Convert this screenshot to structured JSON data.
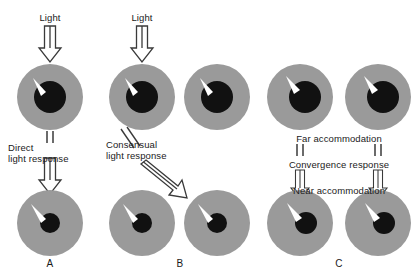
{
  "figure": {
    "background_color": "#ffffff",
    "iris_color": "#9a9a9a",
    "pupil_color": "#111111",
    "highlight_color": "#ffffff",
    "arrow_color": "#3a3a3a",
    "text_color": "#1a1a1a"
  },
  "panels": [
    {
      "id": "A",
      "letter": "A",
      "stimulus_label": "Light",
      "response_label_line1": "Direct",
      "response_label_line2": "light response"
    },
    {
      "id": "B",
      "letter": "B",
      "stimulus_label": "Light",
      "response_label_line1": "Consensual",
      "response_label_line2": "light response"
    },
    {
      "id": "C",
      "letter": "C",
      "state_label_top": "Far accommodation",
      "response_label": "Convergence response",
      "state_label_bottom": "Near accommodation"
    }
  ],
  "eyes": [
    {
      "name": "panel-a-top-eye",
      "cx": 50,
      "cy": 97,
      "r": 33,
      "pupil_cx": 50,
      "pupil_cy": 97,
      "pupil_r": 16,
      "state": "dilated"
    },
    {
      "name": "panel-a-bottom-eye",
      "cx": 50,
      "cy": 223,
      "r": 33,
      "pupil_cx": 50,
      "pupil_cy": 223,
      "pupil_r": 10,
      "state": "constricted"
    },
    {
      "name": "panel-b-top-left-eye",
      "cx": 142,
      "cy": 97,
      "r": 33,
      "pupil_cx": 142,
      "pupil_cy": 97,
      "pupil_r": 16,
      "state": "dilated"
    },
    {
      "name": "panel-b-top-right-eye",
      "cx": 217,
      "cy": 97,
      "r": 33,
      "pupil_cx": 217,
      "pupil_cy": 97,
      "pupil_r": 16,
      "state": "dilated"
    },
    {
      "name": "panel-b-bottom-left-eye",
      "cx": 142,
      "cy": 223,
      "r": 33,
      "pupil_cx": 142,
      "pupil_cy": 223,
      "pupil_r": 10,
      "state": "constricted"
    },
    {
      "name": "panel-b-bottom-right-eye",
      "cx": 217,
      "cy": 223,
      "r": 33,
      "pupil_cx": 217,
      "pupil_cy": 223,
      "pupil_r": 10,
      "state": "constricted"
    },
    {
      "name": "panel-c-top-left-eye",
      "cx": 300,
      "cy": 97,
      "r": 33,
      "pupil_cx": 305,
      "pupil_cy": 97,
      "pupil_r": 16,
      "state": "far-accommodation"
    },
    {
      "name": "panel-c-top-right-eye",
      "cx": 378,
      "cy": 97,
      "r": 33,
      "pupil_cx": 383,
      "pupil_cy": 97,
      "pupil_r": 16,
      "state": "far-accommodation"
    },
    {
      "name": "panel-c-bottom-left-eye",
      "cx": 300,
      "cy": 223,
      "r": 33,
      "pupil_cx": 306,
      "pupil_cy": 223,
      "pupil_r": 11,
      "state": "near-accommodation-converged"
    },
    {
      "name": "panel-c-bottom-right-eye",
      "cx": 378,
      "cy": 223,
      "r": 33,
      "pupil_cx": 384,
      "pupil_cy": 223,
      "pupil_r": 11,
      "state": "near-accommodation-converged"
    }
  ],
  "labels": {
    "a_light": "Light",
    "a_direct_1": "Direct",
    "a_direct_2": "light response",
    "a_letter": "A",
    "b_light": "Light",
    "b_consensual_1": "Consensual",
    "b_consensual_2": "light response",
    "b_letter": "B",
    "c_far": "Far accommodation",
    "c_convergence": "Convergence response",
    "c_near": "Near accommodation",
    "c_letter": "C"
  }
}
